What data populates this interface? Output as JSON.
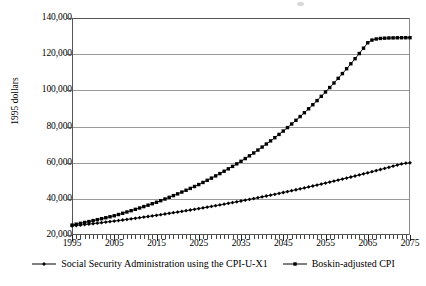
{
  "chart_data": {
    "type": "line",
    "title": "",
    "xlabel": "",
    "ylabel": "1995 dollars",
    "xlim": [
      1995,
      2075
    ],
    "ylim": [
      20000,
      140000
    ],
    "ytick_step": 20000,
    "xtick_step": 10,
    "grid": true,
    "legend_position": "bottom",
    "ytick_labels": [
      "140,000",
      "120,000",
      "100,000",
      "80,000",
      "60,000",
      "40,000",
      "20,000"
    ],
    "ytick_values": [
      140000,
      120000,
      100000,
      80000,
      60000,
      40000,
      20000
    ],
    "xtick_labels": [
      "1995",
      "2005",
      "2015",
      "2025",
      "2035",
      "2045",
      "2055",
      "2065",
      "2075"
    ],
    "xtick_values": [
      1995,
      2005,
      2015,
      2025,
      2035,
      2045,
      2055,
      2065,
      2075
    ],
    "x": [
      1995,
      1996,
      1997,
      1998,
      1999,
      2000,
      2001,
      2002,
      2003,
      2004,
      2005,
      2006,
      2007,
      2008,
      2009,
      2010,
      2011,
      2012,
      2013,
      2014,
      2015,
      2016,
      2017,
      2018,
      2019,
      2020,
      2021,
      2022,
      2023,
      2024,
      2025,
      2026,
      2027,
      2028,
      2029,
      2030,
      2031,
      2032,
      2033,
      2034,
      2035,
      2036,
      2037,
      2038,
      2039,
      2040,
      2041,
      2042,
      2043,
      2044,
      2045,
      2046,
      2047,
      2048,
      2049,
      2050,
      2051,
      2052,
      2053,
      2054,
      2055,
      2056,
      2057,
      2058,
      2059,
      2060,
      2061,
      2062,
      2063,
      2064,
      2065,
      2066,
      2067,
      2068,
      2069,
      2070,
      2071,
      2072,
      2073,
      2074,
      2075
    ],
    "series": [
      {
        "name": "Social Security Administration using the CPI-U-X1",
        "marker": "diamond",
        "color": "#000000",
        "values": [
          25000,
          25250,
          25500,
          25760,
          26020,
          26290,
          26560,
          26840,
          27120,
          27410,
          27700,
          28000,
          28300,
          28610,
          28920,
          29240,
          29560,
          29890,
          30220,
          30560,
          30900,
          31250,
          31600,
          31960,
          32320,
          32690,
          33060,
          33440,
          33820,
          34210,
          34600,
          35000,
          35400,
          35810,
          36220,
          36640,
          37060,
          37490,
          37920,
          38360,
          38800,
          39250,
          39700,
          40160,
          40620,
          41090,
          41560,
          42040,
          42520,
          43010,
          43500,
          44000,
          44500,
          45010,
          45520,
          46040,
          46560,
          47090,
          47620,
          48160,
          48700,
          49250,
          49800,
          50360,
          50920,
          51490,
          52060,
          52640,
          53220,
          53810,
          54400,
          55000,
          55600,
          56210,
          56820,
          57440,
          58060,
          58690,
          59320,
          59700,
          59900
        ]
      },
      {
        "name": "Boskin-adjusted CPI",
        "marker": "square",
        "color": "#000000",
        "values": [
          25500,
          25970,
          26450,
          26940,
          27440,
          27950,
          28470,
          29000,
          29540,
          30090,
          30650,
          31330,
          32020,
          32730,
          33450,
          34190,
          34940,
          35710,
          36490,
          37290,
          38100,
          38990,
          39900,
          40830,
          41780,
          42750,
          43740,
          44750,
          45780,
          46830,
          47900,
          49060,
          50240,
          51450,
          52690,
          53960,
          55260,
          56590,
          57950,
          59340,
          60760,
          62260,
          63790,
          65360,
          66970,
          68620,
          70310,
          72040,
          73810,
          75620,
          77470,
          79400,
          81380,
          83410,
          85490,
          87620,
          89800,
          92040,
          94330,
          96680,
          99090,
          101540,
          104050,
          106620,
          109250,
          111940,
          114690,
          117500,
          120370,
          123300,
          126300,
          127800,
          128400,
          128700,
          128850,
          128950,
          129000,
          129050,
          129080,
          129100,
          129100
        ]
      }
    ]
  },
  "legend": {
    "entries": [
      {
        "label": "Social Security Administration using the CPI-U-X1",
        "marker": "diamond"
      },
      {
        "label": "Boskin-adjusted CPI",
        "marker": "square"
      }
    ]
  }
}
